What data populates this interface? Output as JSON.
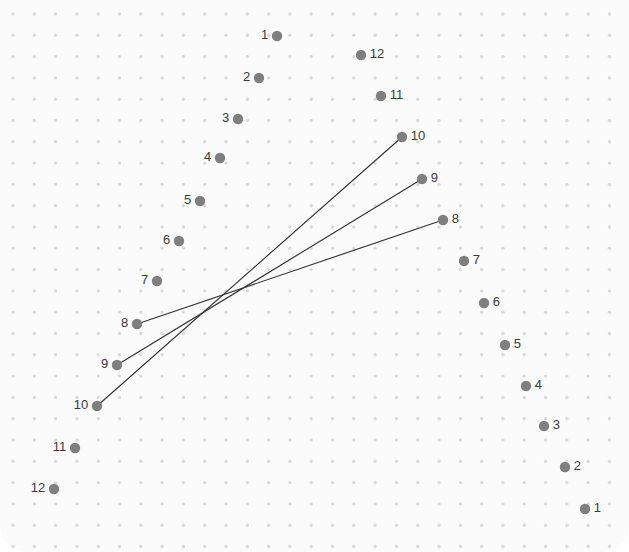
{
  "canvas": {
    "width": 629,
    "height": 552,
    "background_color": "#fbfbfb",
    "page_background_color": "#ffffff",
    "corner_radius": 26
  },
  "grid": {
    "dot_color": "#d9d9d9",
    "dot_radius": 1.7,
    "origin_x": 13,
    "origin_y": 14,
    "spacing_x": 21.3,
    "spacing_y": 21.3,
    "cols": 29,
    "rows": 26
  },
  "style": {
    "node_color": "#7f7f7f",
    "node_radius": 5.2,
    "label_color": "#3a3a3a",
    "label_font_size": 13,
    "edge_color": "#333333",
    "edge_width": 1.15
  },
  "chart_data": {
    "type": "scatter",
    "title": "",
    "xlabel": "",
    "ylabel": "",
    "xlim": [
      0,
      629
    ],
    "ylim": [
      0,
      552
    ],
    "grid": true,
    "legend": "none",
    "series": [
      {
        "name": "left-column",
        "label_side": "left",
        "points": [
          {
            "label": "1",
            "x": 277,
            "y": 36
          },
          {
            "label": "2",
            "x": 259,
            "y": 78
          },
          {
            "label": "3",
            "x": 238,
            "y": 119
          },
          {
            "label": "4",
            "x": 220,
            "y": 158
          },
          {
            "label": "5",
            "x": 200,
            "y": 201
          },
          {
            "label": "6",
            "x": 179,
            "y": 241
          },
          {
            "label": "7",
            "x": 157,
            "y": 281
          },
          {
            "label": "8",
            "x": 137,
            "y": 324
          },
          {
            "label": "9",
            "x": 117,
            "y": 365
          },
          {
            "label": "10",
            "x": 97,
            "y": 406
          },
          {
            "label": "11",
            "x": 75,
            "y": 448
          },
          {
            "label": "12",
            "x": 54,
            "y": 489
          }
        ]
      },
      {
        "name": "right-column",
        "label_side": "right",
        "points": [
          {
            "label": "12",
            "x": 361,
            "y": 55
          },
          {
            "label": "11",
            "x": 381,
            "y": 96
          },
          {
            "label": "10",
            "x": 402,
            "y": 137
          },
          {
            "label": "9",
            "x": 422,
            "y": 179
          },
          {
            "label": "8",
            "x": 443,
            "y": 220
          },
          {
            "label": "7",
            "x": 464,
            "y": 261
          },
          {
            "label": "6",
            "x": 484,
            "y": 303
          },
          {
            "label": "5",
            "x": 505,
            "y": 345
          },
          {
            "label": "4",
            "x": 526,
            "y": 386
          },
          {
            "label": "3",
            "x": 544,
            "y": 426
          },
          {
            "label": "2",
            "x": 565,
            "y": 467
          },
          {
            "label": "1",
            "x": 585,
            "y": 509
          }
        ]
      }
    ],
    "edges": [
      {
        "name": "edge-8-to-8",
        "from_label": "8",
        "to_label": "8",
        "x1": 137,
        "y1": 324,
        "x2": 443,
        "y2": 220
      },
      {
        "name": "edge-9-to-9",
        "from_label": "9",
        "to_label": "9",
        "x1": 117,
        "y1": 365,
        "x2": 422,
        "y2": 179
      },
      {
        "name": "edge-10-to-10",
        "from_label": "10",
        "to_label": "10",
        "x1": 97,
        "y1": 406,
        "x2": 402,
        "y2": 137
      }
    ]
  }
}
